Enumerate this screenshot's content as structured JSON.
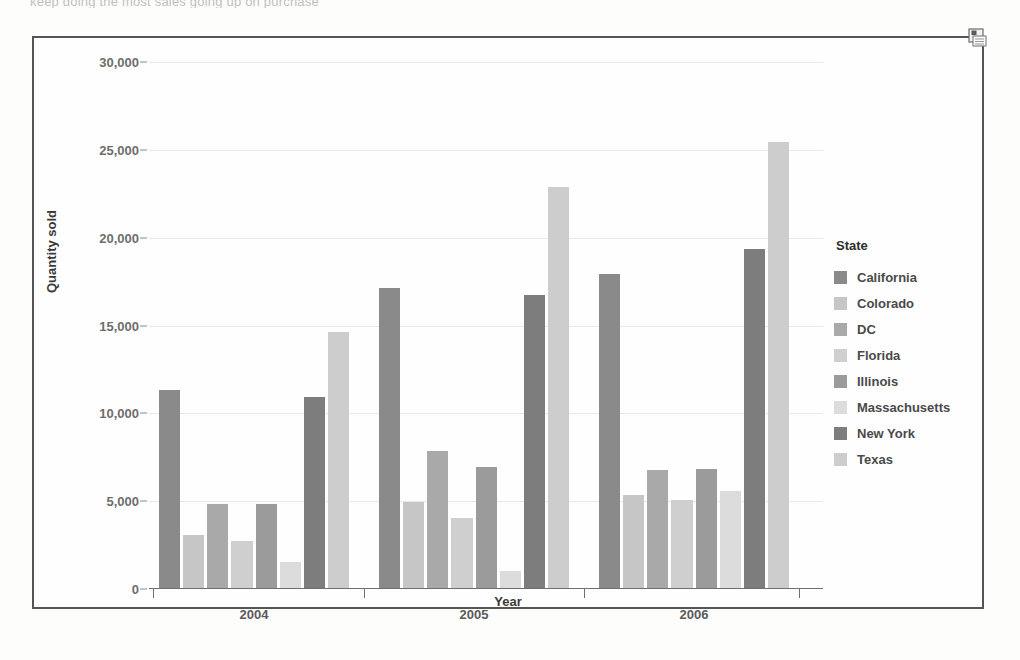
{
  "scan": {
    "top_cut_text": "keep doing the most sales                        going up on purchase"
  },
  "frame": {
    "save_icon": "save-icon"
  },
  "chart_data": {
    "type": "bar",
    "title": "",
    "xlabel": "Year",
    "ylabel": "Quantity sold",
    "categories": [
      "2004",
      "2005",
      "2006"
    ],
    "ylim": [
      0,
      30000
    ],
    "yticks": [
      0,
      5000,
      10000,
      15000,
      20000,
      25000,
      30000
    ],
    "ytick_labels": [
      "0",
      "5,000",
      "10,000",
      "15,000",
      "20,000",
      "25,000",
      "30,000"
    ],
    "grid": true,
    "legend_title": "State",
    "legend_position": "right",
    "series": [
      {
        "name": "California",
        "color": "#8a8a8a",
        "values": [
          11300,
          17100,
          17900
        ]
      },
      {
        "name": "Colorado",
        "color": "#c6c6c6",
        "values": [
          3000,
          4900,
          5300
        ]
      },
      {
        "name": "DC",
        "color": "#a9a9a9",
        "values": [
          4800,
          7800,
          6700
        ]
      },
      {
        "name": "Florida",
        "color": "#cfcfcf",
        "values": [
          2700,
          4000,
          5000
        ]
      },
      {
        "name": "Illinois",
        "color": "#9b9b9b",
        "values": [
          4800,
          6900,
          6800
        ]
      },
      {
        "name": "Massachusetts",
        "color": "#dcdcdc",
        "values": [
          1500,
          950,
          5500
        ]
      },
      {
        "name": "New York",
        "color": "#7d7d7d",
        "values": [
          10900,
          16700,
          19300
        ]
      },
      {
        "name": "Texas",
        "color": "#cdcdcd",
        "values": [
          14600,
          22800,
          25400
        ]
      }
    ]
  }
}
